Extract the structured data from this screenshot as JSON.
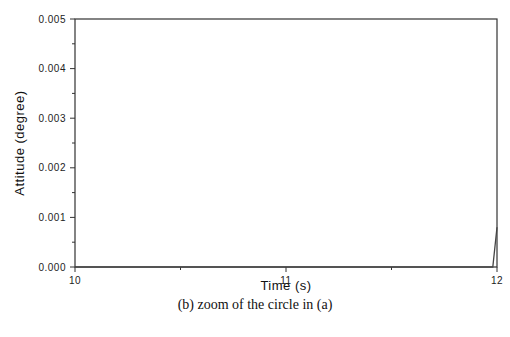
{
  "chart_data": {
    "type": "line",
    "title": "",
    "caption": "(b) zoom of the circle in (a)",
    "xlabel": "Time (s)",
    "ylabel": "Attitude (degree)",
    "xlim": [
      10,
      12
    ],
    "ylim": [
      0,
      0.005
    ],
    "x_ticks": [
      10,
      11,
      12
    ],
    "x_tick_labels": [
      "10",
      "11",
      "12"
    ],
    "x_minor_ticks": [
      10.5,
      11.5
    ],
    "y_ticks": [
      0,
      0.001,
      0.002,
      0.003,
      0.004,
      0.005
    ],
    "y_tick_labels": [
      "0.000",
      "0.001",
      "0.002",
      "0.003",
      "0.004",
      "0.005"
    ],
    "y_minor_ticks": [
      0.0005,
      0.0015,
      0.0025,
      0.0035,
      0.0045
    ],
    "grid": false,
    "legend": null,
    "series": [
      {
        "name": "attitude",
        "color": "#444444",
        "x": [
          10.0,
          10.5,
          11.0,
          11.5,
          11.98,
          12.0
        ],
        "y": [
          0.0,
          0.0,
          0.0,
          0.0,
          0.0,
          0.0008
        ]
      }
    ]
  },
  "colors": {
    "axis": "#333333",
    "line": "#444444",
    "background": "#ffffff"
  }
}
